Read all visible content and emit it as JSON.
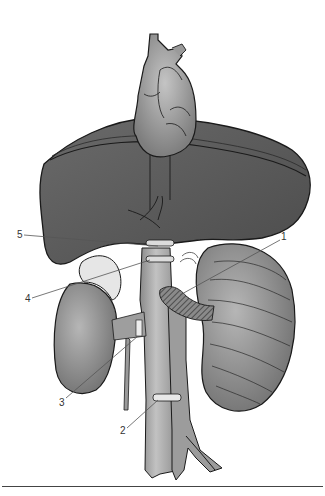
{
  "figure": {
    "structures": [
      "heart",
      "liver",
      "inferior-vena-cava",
      "aorta",
      "right-kidney",
      "left-kidney",
      "adrenal-gland",
      "renal-vein",
      "iliac-bifurcation"
    ],
    "colors": {
      "liver": "#5a5a5a",
      "heart": "#9a9a9a",
      "kidney": "#8c8c8c",
      "vessel": "#a0a0a0",
      "outline": "#1a1a1a",
      "ring": "#dcdcdc",
      "leader_line": "#555555",
      "background": "#ffffff"
    }
  },
  "callouts": [
    {
      "number": "1",
      "x": 281,
      "y": 237
    },
    {
      "number": "2",
      "x": 120,
      "y": 428
    },
    {
      "number": "3",
      "x": 59,
      "y": 400
    },
    {
      "number": "4",
      "x": 25,
      "y": 296
    },
    {
      "number": "5",
      "x": 17,
      "y": 231
    }
  ]
}
